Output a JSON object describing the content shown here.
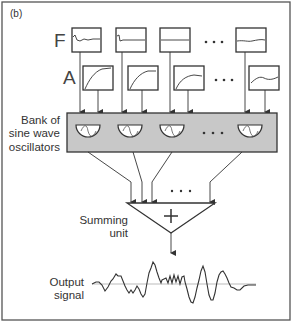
{
  "panel_label": "(b)",
  "rows": {
    "frequency": {
      "label": "F",
      "envelope_count_shown": 4,
      "ellipsis": "· · ·"
    },
    "amplitude": {
      "label": "A",
      "envelope_count_shown": 4,
      "ellipsis": "· · ·"
    }
  },
  "bank": {
    "label_line1": "Bank of",
    "label_line2": "sine wave",
    "label_line3": "oscillators",
    "oscillator_count_shown": 4,
    "ellipsis": "· · ·",
    "fill_color": "#c8c8c8"
  },
  "summing": {
    "label_line1": "Summing",
    "label_line2": "unit",
    "symbol": "+",
    "ellipsis": "· · ·"
  },
  "output": {
    "label_line1": "Output",
    "label_line2": "signal"
  },
  "colors": {
    "stroke": "#333333",
    "border": "#555555",
    "baseline": "#aaaaaa"
  }
}
